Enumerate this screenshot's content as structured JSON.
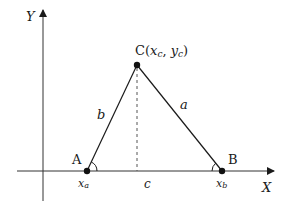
{
  "diagram": {
    "axes": {
      "x_label": "X",
      "y_label": "Y"
    },
    "vertices": {
      "A": {
        "label": "A",
        "coord_label": "x",
        "coord_sub": "a"
      },
      "B": {
        "label": "B",
        "coord_label": "x",
        "coord_sub": "b"
      },
      "C": {
        "label_prefix": "C(",
        "x": "x",
        "x_sub": "c",
        "sep": ", ",
        "y": "y",
        "y_sub": "c",
        "label_suffix": ")"
      }
    },
    "sides": {
      "a": "a",
      "b": "b",
      "c": "c"
    },
    "colors": {
      "line": "#1a1a1a",
      "axis": "#333333",
      "background": "#ffffff"
    }
  }
}
